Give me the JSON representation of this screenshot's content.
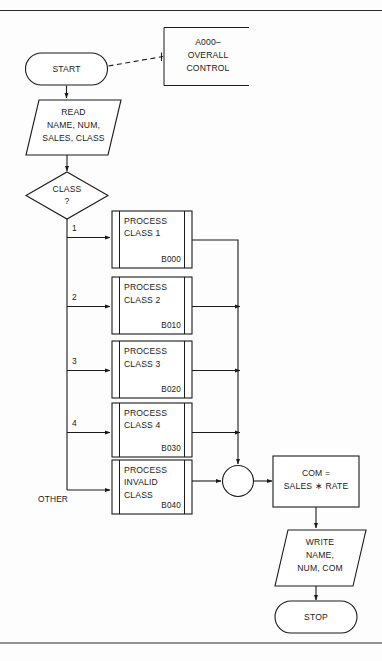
{
  "page": {
    "type": "flowchart",
    "background": "#fdfdfd",
    "ink": "#1a1a1a"
  },
  "rules": {
    "top_label": "top-divider-rule",
    "bottom_label": "bottom-divider-rule"
  },
  "nodes": {
    "start": {
      "kind": "terminator",
      "label": "START"
    },
    "annotation": {
      "kind": "annotation",
      "lines": [
        "A000–",
        "OVERALL",
        "CONTROL"
      ]
    },
    "read": {
      "kind": "input-output",
      "lines": [
        "READ",
        "NAME, NUM,",
        "SALES, CLASS"
      ]
    },
    "decision": {
      "kind": "decision",
      "lines": [
        "CLASS",
        "?"
      ]
    },
    "process_1": {
      "kind": "predefined-process",
      "lines": [
        "PROCESS",
        "CLASS 1"
      ],
      "ref": "B000"
    },
    "process_2": {
      "kind": "predefined-process",
      "lines": [
        "PROCESS",
        "CLASS 2"
      ],
      "ref": "B010"
    },
    "process_3": {
      "kind": "predefined-process",
      "lines": [
        "PROCESS",
        "CLASS 3"
      ],
      "ref": "B020"
    },
    "process_4": {
      "kind": "predefined-process",
      "lines": [
        "PROCESS",
        "CLASS 4"
      ],
      "ref": "B030"
    },
    "process_invalid": {
      "kind": "predefined-process",
      "lines": [
        "PROCESS",
        "INVALID",
        "CLASS"
      ],
      "ref": "B040"
    },
    "junction": {
      "kind": "connector",
      "label": ""
    },
    "compute": {
      "kind": "process",
      "lines": [
        "COM =",
        "SALES ∗ RATE"
      ]
    },
    "write": {
      "kind": "input-output",
      "lines": [
        "WRITE",
        "NAME,",
        "NUM, COM"
      ]
    },
    "stop": {
      "kind": "terminator",
      "label": "STOP"
    }
  },
  "branch_labels": {
    "b1": "1",
    "b2": "2",
    "b3": "3",
    "b4": "4",
    "b5": "OTHER"
  }
}
